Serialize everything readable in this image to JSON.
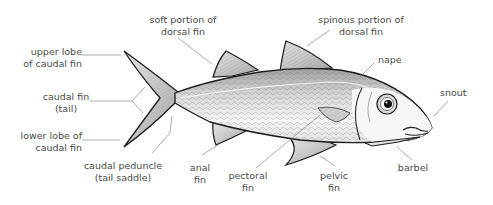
{
  "labels": {
    "soft_dorsal": [
      "soft portion of",
      "dorsal fin"
    ],
    "spinous_dorsal": [
      "spinous portion of",
      "dorsal fin"
    ],
    "upper_lobe": [
      "upper lobe",
      "of caudal fin"
    ],
    "caudal_fin": [
      "caudal fin",
      "(tail)"
    ],
    "lower_lobe": [
      "lower lobe of",
      "caudal fin"
    ],
    "caudal_peduncle": [
      "caudal peduncle",
      "(tail saddle)"
    ],
    "anal_fin": [
      "anal",
      "fin"
    ],
    "pectoral_fin": [
      "pectoral",
      "fin"
    ],
    "pelvic_fin": [
      "pelvic",
      "fin"
    ],
    "barbel": [
      "barbel"
    ],
    "nape": [
      "nape"
    ],
    "snout": [
      "snout"
    ]
  },
  "colors": {
    "outline": "#1a1a1a",
    "body_light": "#f2f2f2",
    "body_shade": "#bdbdbd",
    "fin": "#cfcfcf",
    "leader": "#8a8a8a",
    "text": "#4a4a4a"
  }
}
